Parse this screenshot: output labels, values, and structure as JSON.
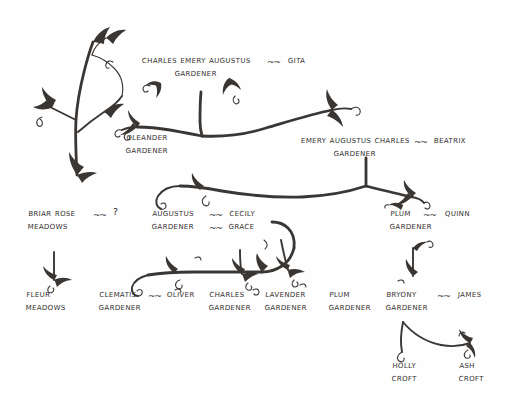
{
  "document": {
    "kind": "hand-drawn family tree",
    "title": "Gardener Family Tree",
    "background_color": "#fefefe",
    "ink_color": "#33302e",
    "union_symbol": "~~"
  },
  "decor": {
    "vine_label": "decorative-vine-sprig"
  },
  "nodes": {
    "charles_emery_augustus": {
      "given": "Charles Emery Augustus",
      "surname": "Gardener"
    },
    "gita": {
      "given": "Gita",
      "surname": ""
    },
    "oleander": {
      "given": "Oleander",
      "surname": "Gardener"
    },
    "emery_augustus_charles": {
      "given": "Emery Augustus Charles",
      "surname": "Gardener"
    },
    "beatrix": {
      "given": "Beatrix",
      "surname": ""
    },
    "briar_rose": {
      "given": "Briar Rose",
      "surname": "Meadows"
    },
    "briar_rose_spouse": {
      "given": "?",
      "surname": ""
    },
    "augustus": {
      "given": "Augustus",
      "surname": "Gardener"
    },
    "cecily": {
      "given": "Cecily",
      "surname": "Grace"
    },
    "plum_parent": {
      "given": "Plum",
      "surname": "Gardener"
    },
    "quinn": {
      "given": "Quinn",
      "surname": ""
    },
    "fleur": {
      "given": "Fleur",
      "surname": "Meadows"
    },
    "clematis": {
      "given": "Clematis",
      "surname": "Gardener"
    },
    "oliver": {
      "given": "Oliver",
      "surname": ""
    },
    "charles": {
      "given": "Charles",
      "surname": "Gardener"
    },
    "lavender": {
      "given": "Lavender",
      "surname": "Gardener"
    },
    "plum_child": {
      "given": "Plum",
      "surname": "Gardener"
    },
    "bryony": {
      "given": "Bryony",
      "surname": "Gardener"
    },
    "james": {
      "given": "James",
      "surname": ""
    },
    "holly": {
      "given": "Holly",
      "surname": "Croft"
    },
    "ash": {
      "given": "Ash",
      "surname": "Croft"
    }
  },
  "unions": {
    "u1": "~~",
    "u2": "~~",
    "u3": "~~",
    "u4": "~~",
    "u5": "~~",
    "u6": "~~",
    "u7": "~~",
    "u8": "~~",
    "u9": "~~"
  }
}
